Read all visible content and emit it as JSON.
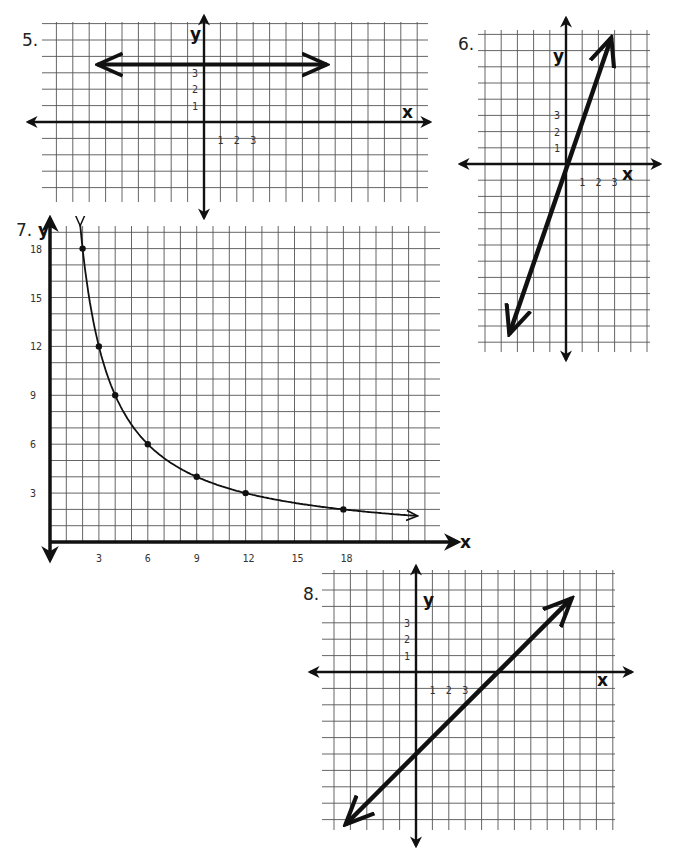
{
  "page": {
    "background": "#ffffff",
    "ink": "#111111",
    "grid_color": "#555555"
  },
  "chart_data": [
    {
      "id": "graph-5",
      "label": "5.",
      "type": "line",
      "equation": "y = 3.5",
      "xlabel": "x",
      "ylabel": "y",
      "x_tick_labels": [
        "1",
        "2",
        "3"
      ],
      "y_tick_labels": [
        "1",
        "2",
        "3"
      ],
      "grid": true,
      "xlim": [
        -9,
        12
      ],
      "ylim": [
        -5,
        6
      ],
      "points": [
        [
          -6.5,
          3.5
        ],
        [
          7.5,
          3.5
        ]
      ],
      "arrows": "both"
    },
    {
      "id": "graph-6",
      "label": "6.",
      "type": "line",
      "equation": "y = 3x",
      "xlabel": "x",
      "ylabel": "y",
      "x_tick_labels": [
        "1",
        "2",
        "3"
      ],
      "y_tick_labels": [
        "1",
        "2",
        "3"
      ],
      "grid": true,
      "xlim": [
        -6,
        4
      ],
      "ylim": [
        -11,
        7
      ],
      "points": [
        [
          -3.5,
          -10.5
        ],
        [
          2.8,
          7.8
        ]
      ],
      "arrows": "both"
    },
    {
      "id": "graph-7",
      "label": "7.",
      "type": "scatter",
      "equation": "y = 36/x",
      "xlabel": "x",
      "ylabel": "y",
      "x_tick_labels": [
        "3",
        "6",
        "9",
        "12",
        "15",
        "18"
      ],
      "x_tick_values": [
        3,
        6,
        9,
        12,
        15,
        18
      ],
      "y_tick_labels": [
        "3",
        "6",
        "9",
        "12",
        "15",
        "18"
      ],
      "y_tick_values": [
        3,
        6,
        9,
        12,
        15,
        18
      ],
      "grid": true,
      "xlim": [
        0,
        24
      ],
      "ylim": [
        0,
        19
      ],
      "points": [
        [
          2,
          18
        ],
        [
          3,
          12
        ],
        [
          4,
          9
        ],
        [
          6,
          6
        ],
        [
          9,
          4
        ],
        [
          12,
          3
        ],
        [
          18,
          2
        ]
      ],
      "curve": "hyperbola",
      "arrows": "both"
    },
    {
      "id": "graph-8",
      "label": "8.",
      "type": "line",
      "equation": "y = x - 5",
      "xlabel": "x",
      "ylabel": "y",
      "x_tick_labels": [
        "1",
        "2",
        "3"
      ],
      "y_tick_labels": [
        "1",
        "2",
        "3"
      ],
      "grid": true,
      "xlim": [
        -6,
        13
      ],
      "ylim": [
        -9,
        5
      ],
      "points": [
        [
          -4.3,
          -9.3
        ],
        [
          9.5,
          4.5
        ]
      ],
      "arrows": "both"
    }
  ],
  "layout": [
    {
      "origin": [
        204,
        122
      ],
      "unit": 16.4,
      "grid_box": [
        42,
        22,
        428,
        202
      ],
      "axis_box": [
        28,
        16,
        430,
        218
      ],
      "label_pos": [
        22,
        46
      ],
      "xname_pos": [
        402,
        118
      ],
      "yname_pos": [
        190,
        40
      ]
    },
    {
      "origin": [
        566,
        164
      ],
      "unit": 16.2,
      "grid_box": [
        478,
        30,
        650,
        352
      ],
      "axis_box": [
        460,
        18,
        660,
        360
      ],
      "label_pos": [
        458,
        50
      ],
      "xname_pos": [
        622,
        180
      ],
      "yname_pos": [
        553,
        62
      ]
    },
    {
      "origin": [
        50,
        542
      ],
      "unit": 16.3,
      "grid_box": [
        50,
        226,
        440,
        542
      ],
      "axis_box": [
        50,
        218,
        458,
        562
      ],
      "label_pos": [
        16,
        236
      ],
      "xname_pos": [
        460,
        548
      ],
      "yname_pos": [
        38,
        236
      ]
    },
    {
      "origin": [
        416,
        672
      ],
      "unit": 16.4,
      "grid_box": [
        322,
        570,
        615,
        830
      ],
      "axis_box": [
        310,
        566,
        632,
        846
      ],
      "label_pos": [
        303,
        600
      ],
      "xname_pos": [
        597,
        686
      ],
      "yname_pos": [
        423,
        606
      ]
    }
  ]
}
